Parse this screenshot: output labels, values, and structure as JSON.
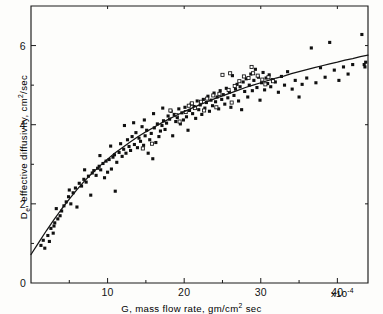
{
  "figure": {
    "caption_x": "G, mass flow rate, gm/cm",
    "caption_x_sup": "2",
    "caption_x_tail": " sec",
    "caption_y_lead": "D",
    "caption_y_sub": "e",
    "caption_y_mid": ", effective diffusivity, cm",
    "caption_y_sup": "2",
    "caption_y_tail": "/sec",
    "x_exponent_mult": "x10",
    "x_exponent_power": "-4"
  },
  "chart_data": {
    "type": "scatter",
    "title": "",
    "xlabel": "G, mass flow rate, gm/cm2 sec",
    "ylabel": "De, effective diffusivity, cm2/sec",
    "xlim": [
      0,
      44
    ],
    "ylim": [
      0,
      7
    ],
    "x_scale_note": "values x10^-4",
    "grid": false,
    "legend": "none",
    "xticks_major": [
      0,
      10,
      20,
      30,
      40
    ],
    "xtick_labels": [
      "0",
      "10",
      "20",
      "30",
      "40"
    ],
    "xticks_minor": [
      5,
      15,
      25,
      35
    ],
    "yticks_major": [
      2,
      4,
      6
    ],
    "ytick_labels": [
      "2",
      "4",
      "6"
    ],
    "yticks_minor": [
      1,
      3,
      5
    ],
    "fit_curve": {
      "name": "fitted correlation",
      "x": [
        0.0,
        1.0,
        2.0,
        3.0,
        4.0,
        5.0,
        6.0,
        7.0,
        8.0,
        9.0,
        10.0,
        11.0,
        12.0,
        13.0,
        14.0,
        15.0,
        16.0,
        17.0,
        18.0,
        19.0,
        20.0,
        21.0,
        22.0,
        23.0,
        24.0,
        25.0,
        26.0,
        27.0,
        28.0,
        29.0,
        30.0,
        31.0,
        32.0,
        33.0,
        34.0,
        35.0,
        36.0,
        37.0,
        38.0,
        39.0,
        40.0,
        41.0,
        42.0,
        43.0,
        44.0
      ],
      "y": [
        0.72,
        1.02,
        1.32,
        1.6,
        1.87,
        2.12,
        2.36,
        2.58,
        2.78,
        2.96,
        3.13,
        3.29,
        3.43,
        3.57,
        3.7,
        3.82,
        3.93,
        4.04,
        4.14,
        4.24,
        4.33,
        4.42,
        4.5,
        4.58,
        4.66,
        4.73,
        4.8,
        4.87,
        4.94,
        5.0,
        5.06,
        5.12,
        5.18,
        5.23,
        5.29,
        5.34,
        5.39,
        5.44,
        5.49,
        5.54,
        5.58,
        5.63,
        5.67,
        5.72,
        5.76
      ]
    },
    "series": [
      {
        "name": "experimental data",
        "marker": "filled-square",
        "points": [
          [
            1.3,
            0.95
          ],
          [
            1.6,
            1.08
          ],
          [
            1.8,
            0.88
          ],
          [
            2.2,
            1.2
          ],
          [
            2.4,
            1.05
          ],
          [
            2.6,
            1.38
          ],
          [
            2.9,
            1.26
          ],
          [
            3.1,
            1.52
          ],
          [
            3.3,
            1.88
          ],
          [
            3.5,
            1.62
          ],
          [
            3.8,
            1.7
          ],
          [
            4.0,
            1.82
          ],
          [
            4.3,
            1.95
          ],
          [
            4.6,
            2.05
          ],
          [
            4.9,
            2.18
          ],
          [
            5.2,
            2.0
          ],
          [
            5.5,
            2.28
          ],
          [
            5.8,
            2.4
          ],
          [
            6.0,
            1.92
          ],
          [
            6.3,
            2.52
          ],
          [
            6.6,
            2.45
          ],
          [
            6.9,
            2.62
          ],
          [
            7.2,
            2.55
          ],
          [
            7.5,
            2.7
          ],
          [
            7.8,
            2.22
          ],
          [
            8.0,
            2.78
          ],
          [
            8.2,
            2.84
          ],
          [
            8.5,
            2.72
          ],
          [
            8.7,
            2.9
          ],
          [
            8.9,
            2.95
          ],
          [
            9.1,
            2.86
          ],
          [
            9.4,
            3.02
          ],
          [
            9.6,
            2.66
          ],
          [
            9.8,
            3.08
          ],
          [
            10.0,
            2.8
          ],
          [
            10.2,
            3.12
          ],
          [
            10.5,
            2.88
          ],
          [
            10.7,
            3.18
          ],
          [
            10.9,
            3.24
          ],
          [
            11.0,
            2.32
          ],
          [
            11.2,
            3.05
          ],
          [
            11.5,
            3.3
          ],
          [
            11.7,
            3.52
          ],
          [
            11.9,
            3.2
          ],
          [
            12.1,
            3.38
          ],
          [
            12.4,
            3.28
          ],
          [
            12.6,
            3.62
          ],
          [
            12.8,
            3.45
          ],
          [
            13.0,
            3.35
          ],
          [
            13.2,
            3.7
          ],
          [
            13.5,
            3.5
          ],
          [
            13.7,
            3.8
          ],
          [
            13.9,
            3.42
          ],
          [
            14.1,
            3.66
          ],
          [
            14.3,
            3.58
          ],
          [
            14.5,
            3.95
          ],
          [
            14.7,
            3.48
          ],
          [
            14.9,
            3.72
          ],
          [
            15.1,
            3.86
          ],
          [
            15.3,
            3.28
          ],
          [
            15.5,
            3.62
          ],
          [
            15.7,
            3.78
          ],
          [
            15.9,
            3.14
          ],
          [
            16.1,
            3.92
          ],
          [
            16.3,
            3.55
          ],
          [
            16.5,
            4.02
          ],
          [
            16.7,
            3.7
          ],
          [
            16.9,
            3.84
          ],
          [
            17.1,
            3.98
          ],
          [
            17.3,
            4.1
          ],
          [
            17.5,
            3.88
          ],
          [
            17.7,
            4.04
          ],
          [
            17.9,
            4.22
          ],
          [
            18.1,
            4.14
          ],
          [
            18.3,
            4.34
          ],
          [
            18.5,
            3.72
          ],
          [
            18.7,
            4.26
          ],
          [
            18.9,
            4.08
          ],
          [
            19.1,
            4.18
          ],
          [
            19.3,
            4.4
          ],
          [
            19.5,
            4.02
          ],
          [
            19.7,
            4.3
          ],
          [
            19.9,
            4.12
          ],
          [
            20.1,
            4.44
          ],
          [
            20.3,
            4.2
          ],
          [
            20.5,
            3.86
          ],
          [
            20.7,
            4.36
          ],
          [
            20.9,
            4.52
          ],
          [
            21.1,
            4.28
          ],
          [
            21.3,
            4.46
          ],
          [
            21.5,
            4.16
          ],
          [
            21.7,
            4.6
          ],
          [
            21.9,
            4.38
          ],
          [
            22.1,
            4.5
          ],
          [
            22.3,
            4.26
          ],
          [
            22.5,
            4.64
          ],
          [
            22.7,
            4.42
          ],
          [
            22.9,
            4.56
          ],
          [
            23.1,
            4.72
          ],
          [
            23.3,
            4.34
          ],
          [
            23.5,
            4.62
          ],
          [
            23.7,
            4.48
          ],
          [
            23.9,
            4.8
          ],
          [
            24.1,
            4.58
          ],
          [
            24.3,
            4.7
          ],
          [
            24.5,
            4.4
          ],
          [
            24.7,
            4.86
          ],
          [
            24.9,
            4.64
          ],
          [
            25.1,
            4.76
          ],
          [
            25.3,
            4.52
          ],
          [
            25.5,
            4.92
          ],
          [
            25.7,
            4.68
          ],
          [
            25.9,
            4.82
          ],
          [
            26.1,
            4.44
          ],
          [
            26.3,
            5.24
          ],
          [
            26.5,
            4.74
          ],
          [
            26.7,
            4.9
          ],
          [
            26.9,
            5.02
          ],
          [
            27.1,
            4.6
          ],
          [
            27.3,
            4.96
          ],
          [
            27.5,
            4.38
          ],
          [
            27.7,
            5.08
          ],
          [
            27.9,
            4.84
          ],
          [
            28.1,
            5.16
          ],
          [
            28.3,
            4.7
          ],
          [
            28.5,
            5.0
          ],
          [
            28.7,
            5.28
          ],
          [
            28.9,
            4.86
          ],
          [
            29.1,
            5.12
          ],
          [
            29.3,
            5.4
          ],
          [
            29.5,
            4.94
          ],
          [
            29.7,
            5.2
          ],
          [
            29.9,
            4.62
          ],
          [
            30.1,
            5.06
          ],
          [
            30.3,
            5.32
          ],
          [
            30.5,
            4.88
          ],
          [
            30.7,
            5.18
          ],
          [
            30.9,
            5.04
          ],
          [
            31.1,
            5.26
          ],
          [
            31.3,
            4.96
          ],
          [
            31.5,
            5.14
          ],
          [
            31.9,
            5.08
          ],
          [
            32.3,
            4.82
          ],
          [
            32.7,
            5.22
          ],
          [
            33.1,
            5.0
          ],
          [
            33.5,
            5.34
          ],
          [
            34.1,
            4.9
          ],
          [
            34.5,
            5.12
          ],
          [
            35.0,
            4.7
          ],
          [
            35.4,
            5.02
          ],
          [
            36.0,
            5.18
          ],
          [
            36.6,
            5.94
          ],
          [
            37.2,
            5.06
          ],
          [
            37.8,
            5.44
          ],
          [
            38.4,
            5.2
          ],
          [
            39.0,
            6.08
          ],
          [
            39.6,
            5.38
          ],
          [
            40.2,
            5.12
          ],
          [
            40.8,
            5.46
          ],
          [
            41.4,
            5.28
          ],
          [
            42.0,
            5.52
          ],
          [
            43.2,
            6.28
          ],
          [
            43.5,
            5.52
          ],
          [
            43.6,
            5.46
          ],
          [
            43.7,
            5.58
          ],
          [
            12.2,
            3.98
          ],
          [
            13.4,
            4.05
          ],
          [
            14.8,
            4.12
          ],
          [
            16.0,
            4.28
          ],
          [
            17.2,
            4.42
          ],
          [
            10.4,
            3.46
          ],
          [
            9.0,
            3.22
          ],
          [
            7.0,
            2.86
          ],
          [
            5.0,
            2.35
          ],
          [
            3.0,
            1.44
          ]
        ]
      },
      {
        "name": "experimental data (open symbols)",
        "marker": "open-square",
        "points": [
          [
            14.6,
            3.4
          ],
          [
            15.8,
            3.52
          ],
          [
            18.2,
            4.36
          ],
          [
            19.0,
            4.24
          ],
          [
            20.2,
            4.32
          ],
          [
            21.0,
            4.54
          ],
          [
            22.2,
            4.58
          ],
          [
            23.0,
            4.66
          ],
          [
            23.8,
            4.74
          ],
          [
            24.6,
            4.78
          ],
          [
            25.0,
            5.26
          ],
          [
            25.8,
            4.88
          ],
          [
            26.0,
            5.3
          ],
          [
            26.6,
            4.98
          ],
          [
            27.2,
            5.1
          ],
          [
            27.8,
            5.22
          ],
          [
            28.4,
            5.18
          ],
          [
            29.0,
            5.3
          ],
          [
            29.6,
            5.24
          ],
          [
            30.2,
            5.14
          ],
          [
            24.2,
            4.44
          ],
          [
            22.6,
            4.36
          ],
          [
            21.4,
            4.42
          ],
          [
            20.6,
            4.48
          ],
          [
            19.4,
            4.08
          ],
          [
            31.0,
            5.2
          ],
          [
            31.6,
            5.1
          ],
          [
            26.2,
            4.56
          ],
          [
            28.8,
            5.46
          ],
          [
            30.6,
            5.02
          ]
        ]
      }
    ]
  }
}
